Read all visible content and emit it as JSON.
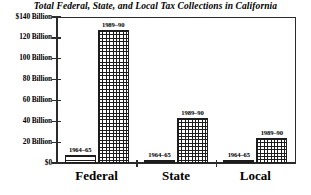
{
  "chart_data": {
    "type": "bar",
    "title": "Total Federal, State, and Local Tax Collections in California",
    "xlabel": "",
    "ylabel": "",
    "ylim": [
      0,
      140
    ],
    "grid": false,
    "legend": "none (series labeled above each bar)",
    "categories": [
      "Federal",
      "State",
      "Local"
    ],
    "ytick_labels": [
      "$140 Billion",
      "120 Billion",
      "100 Billion",
      "80 Billion",
      "60 Billion",
      "40 Billion",
      "20 Billion",
      "$0"
    ],
    "ytick_values": [
      140,
      120,
      100,
      80,
      60,
      40,
      20,
      0
    ],
    "series": [
      {
        "name": "1964–65",
        "pattern": "horizontal-stripes",
        "values": [
          8,
          3,
          3
        ]
      },
      {
        "name": "1989–90",
        "pattern": "cross-hatch-grid",
        "values": [
          128,
          43,
          24
        ]
      }
    ],
    "annotations": [
      {
        "text": "1964–65",
        "category": "Federal",
        "series": "1964–65"
      },
      {
        "text": "1989–90",
        "category": "Federal",
        "series": "1989–90"
      },
      {
        "text": "1964–65",
        "category": "State",
        "series": "1964–65"
      },
      {
        "text": "1989–90",
        "category": "State",
        "series": "1989–90"
      },
      {
        "text": "1964–65",
        "category": "Local",
        "series": "1964–65"
      },
      {
        "text": "1989–90",
        "category": "Local",
        "series": "1989–90"
      }
    ],
    "colors": {
      "axis": "#2b2b2b",
      "bar_outline": "#1c1c1c",
      "bar_fill": "#ffffff",
      "background": "#ffffff",
      "text": "#000000"
    }
  }
}
